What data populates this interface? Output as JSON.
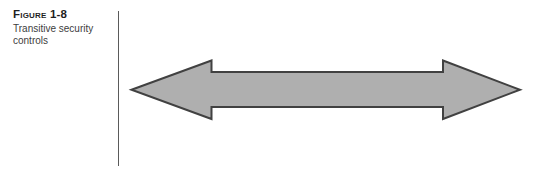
{
  "figure": {
    "label": "Figure 1-8",
    "caption": "Transitive security controls"
  },
  "diagram": {
    "arrow": {
      "type": "double-headed-horizontal-arrow",
      "fill": "#AFAFAF",
      "stroke": "#414141"
    },
    "divider_color": "#5a5a5a"
  }
}
